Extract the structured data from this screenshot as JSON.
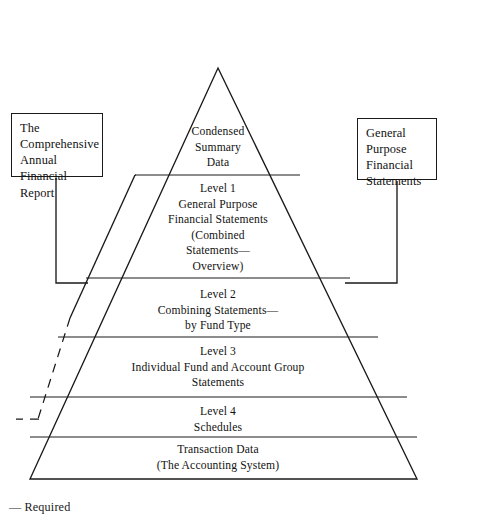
{
  "figure": {
    "kind": "pyramid-diagram",
    "background_color": "#ffffff",
    "line_color": "#1a1a1a"
  },
  "callouts": {
    "left": {
      "text": "The\nComprehensive\nAnnual\nFinancial\nReport",
      "connector": "bracket-to-left-scope-line"
    },
    "right": {
      "text": "General\nPurpose\nFinancial\nStatements",
      "connector": "bracket-to-right-pyramid-edge"
    }
  },
  "pyramid": {
    "apex": {
      "x": 218,
      "y": 68
    },
    "base_left": {
      "x": 30,
      "y": 479
    },
    "base_right": {
      "x": 417,
      "y": 479
    },
    "divider_y": [
      175,
      278,
      337,
      397,
      437
    ],
    "tiers": [
      {
        "index": 0,
        "name": "condensed-summary-data",
        "text": "Condensed\nSummary\nData"
      },
      {
        "index": 1,
        "name": "level-1",
        "text": "Level 1\nGeneral Purpose\nFinancial Statements\n(Combined\nStatements—\nOverview)"
      },
      {
        "index": 2,
        "name": "level-2",
        "text": "Level 2\nCombining Statements—\nby Fund Type"
      },
      {
        "index": 3,
        "name": "level-3",
        "text": "Level 3\nIndividual Fund and Account Group\nStatements"
      },
      {
        "index": 4,
        "name": "level-4",
        "text": "Level 4\nSchedules"
      },
      {
        "index": 5,
        "name": "transaction-data",
        "text": "Transaction Data\n(The Accounting System)"
      }
    ]
  },
  "scope_line": {
    "description": "Outer line parallel to pyramid left edge marking CAFR scope; solid upper portion, dashed lower portion",
    "solid_segment": {
      "x1": 135,
      "y1": 175,
      "x2": 70,
      "y2": 318
    },
    "dashed_segment": {
      "x1": 70,
      "y1": 318,
      "x2": 38,
      "y2": 419
    },
    "dashed_tick": {
      "x1": 38,
      "y1": 419,
      "x2": 17,
      "y2": 419
    }
  },
  "footnote": {
    "text": "— Required"
  }
}
